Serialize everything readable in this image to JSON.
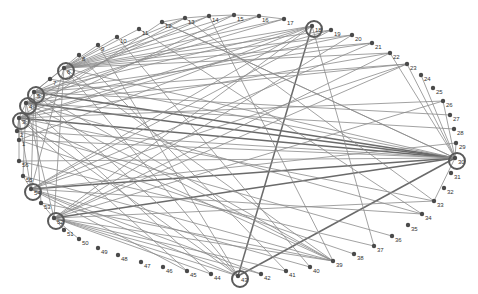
{
  "diagram": {
    "type": "circular-network-graph",
    "colors": {
      "edge": "#8a8a8a",
      "edge_strong": "#6a6a6a",
      "node": "#4a4a4a",
      "hub_ring": "#5a5a5a",
      "label": "#333333"
    },
    "nodes": [
      {
        "id": "1",
        "x": 19,
        "y": 140,
        "hub": false
      },
      {
        "id": "2",
        "x": 17,
        "y": 131,
        "hub": false
      },
      {
        "id": "3",
        "x": 19,
        "y": 118,
        "hub": true
      },
      {
        "id": "4",
        "x": 26,
        "y": 103,
        "hub": true
      },
      {
        "id": "5",
        "x": 34,
        "y": 92,
        "hub": true
      },
      {
        "id": "6",
        "x": 64,
        "y": 68,
        "hub": true
      },
      {
        "id": "7",
        "x": 50,
        "y": 79,
        "hub": false
      },
      {
        "id": "8",
        "x": 79,
        "y": 55,
        "hub": false
      },
      {
        "id": "9",
        "x": 98,
        "y": 45,
        "hub": false
      },
      {
        "id": "10",
        "x": 117,
        "y": 37,
        "hub": false
      },
      {
        "id": "11",
        "x": 139,
        "y": 29,
        "hub": false
      },
      {
        "id": "12",
        "x": 162,
        "y": 22,
        "hub": false
      },
      {
        "id": "13",
        "x": 185,
        "y": 18,
        "hub": false
      },
      {
        "id": "14",
        "x": 209,
        "y": 16,
        "hub": false
      },
      {
        "id": "15",
        "x": 234,
        "y": 15,
        "hub": false
      },
      {
        "id": "16",
        "x": 259,
        "y": 16,
        "hub": false
      },
      {
        "id": "17",
        "x": 284,
        "y": 19,
        "hub": false
      },
      {
        "id": "18",
        "x": 312,
        "y": 26,
        "hub": true
      },
      {
        "id": "19",
        "x": 331,
        "y": 30,
        "hub": false
      },
      {
        "id": "20",
        "x": 352,
        "y": 35,
        "hub": false
      },
      {
        "id": "21",
        "x": 372,
        "y": 43,
        "hub": false
      },
      {
        "id": "22",
        "x": 390,
        "y": 53,
        "hub": false
      },
      {
        "id": "23",
        "x": 407,
        "y": 64,
        "hub": false
      },
      {
        "id": "24",
        "x": 421,
        "y": 75,
        "hub": false
      },
      {
        "id": "25",
        "x": 433,
        "y": 88,
        "hub": false
      },
      {
        "id": "26",
        "x": 443,
        "y": 101,
        "hub": false
      },
      {
        "id": "27",
        "x": 450,
        "y": 115,
        "hub": false
      },
      {
        "id": "28",
        "x": 454,
        "y": 129,
        "hub": false
      },
      {
        "id": "29",
        "x": 456,
        "y": 143,
        "hub": false
      },
      {
        "id": "30",
        "x": 455,
        "y": 158,
        "hub": true
      },
      {
        "id": "31",
        "x": 451,
        "y": 173,
        "hub": false
      },
      {
        "id": "32",
        "x": 444,
        "y": 188,
        "hub": false
      },
      {
        "id": "33",
        "x": 434,
        "y": 201,
        "hub": false
      },
      {
        "id": "34",
        "x": 422,
        "y": 214,
        "hub": false
      },
      {
        "id": "35",
        "x": 408,
        "y": 225,
        "hub": false
      },
      {
        "id": "36",
        "x": 392,
        "y": 236,
        "hub": false
      },
      {
        "id": "37",
        "x": 374,
        "y": 246,
        "hub": false
      },
      {
        "id": "38",
        "x": 354,
        "y": 254,
        "hub": false
      },
      {
        "id": "39",
        "x": 333,
        "y": 261,
        "hub": false
      },
      {
        "id": "40",
        "x": 310,
        "y": 267,
        "hub": false
      },
      {
        "id": "41",
        "x": 286,
        "y": 271,
        "hub": false
      },
      {
        "id": "42",
        "x": 261,
        "y": 274,
        "hub": false
      },
      {
        "id": "43",
        "x": 238,
        "y": 276,
        "hub": true
      },
      {
        "id": "44",
        "x": 211,
        "y": 274,
        "hub": false
      },
      {
        "id": "45",
        "x": 187,
        "y": 271,
        "hub": false
      },
      {
        "id": "46",
        "x": 163,
        "y": 267,
        "hub": false
      },
      {
        "id": "47",
        "x": 141,
        "y": 262,
        "hub": false
      },
      {
        "id": "48",
        "x": 118,
        "y": 255,
        "hub": false
      },
      {
        "id": "49",
        "x": 98,
        "y": 248,
        "hub": false
      },
      {
        "id": "50",
        "x": 79,
        "y": 239,
        "hub": false
      },
      {
        "id": "51",
        "x": 64,
        "y": 230,
        "hub": false
      },
      {
        "id": "52",
        "x": 54,
        "y": 218,
        "hub": true
      },
      {
        "id": "53",
        "x": 41,
        "y": 203,
        "hub": false
      },
      {
        "id": "54",
        "x": 31,
        "y": 189,
        "hub": true
      },
      {
        "id": "55",
        "x": 23,
        "y": 176,
        "hub": false
      },
      {
        "id": "56",
        "x": 19,
        "y": 161,
        "hub": false
      }
    ],
    "edges": [
      [
        "3",
        "30",
        1
      ],
      [
        "4",
        "30",
        1
      ],
      [
        "5",
        "30",
        1
      ],
      [
        "3",
        "18",
        0
      ],
      [
        "6",
        "18",
        0
      ],
      [
        "5",
        "18",
        0
      ],
      [
        "18",
        "43",
        1
      ],
      [
        "30",
        "43",
        1
      ],
      [
        "30",
        "52",
        1
      ],
      [
        "30",
        "54",
        1
      ],
      [
        "30",
        "56",
        0
      ],
      [
        "30",
        "1",
        0
      ],
      [
        "30",
        "2",
        0
      ],
      [
        "30",
        "7",
        0
      ],
      [
        "30",
        "6",
        0
      ],
      [
        "30",
        "12",
        0
      ],
      [
        "30",
        "22",
        0
      ],
      [
        "30",
        "23",
        0
      ],
      [
        "30",
        "26",
        0
      ],
      [
        "30",
        "29",
        0
      ],
      [
        "30",
        "33",
        0
      ],
      [
        "30",
        "24",
        0
      ],
      [
        "3",
        "33",
        0
      ],
      [
        "4",
        "34",
        0
      ],
      [
        "5",
        "39",
        0
      ],
      [
        "6",
        "39",
        0
      ],
      [
        "3",
        "39",
        0
      ],
      [
        "4",
        "39",
        0
      ],
      [
        "52",
        "39",
        0
      ],
      [
        "54",
        "40",
        0
      ],
      [
        "52",
        "41",
        0
      ],
      [
        "54",
        "42",
        0
      ],
      [
        "52",
        "33",
        0
      ],
      [
        "54",
        "34",
        0
      ],
      [
        "3",
        "43",
        0
      ],
      [
        "6",
        "43",
        0
      ],
      [
        "5",
        "43",
        0
      ],
      [
        "4",
        "44",
        0
      ],
      [
        "3",
        "45",
        0
      ],
      [
        "6",
        "9",
        0
      ],
      [
        "6",
        "10",
        0
      ],
      [
        "6",
        "11",
        0
      ],
      [
        "7",
        "8",
        0
      ],
      [
        "5",
        "7",
        0
      ],
      [
        "3",
        "12",
        0
      ],
      [
        "4",
        "13",
        0
      ],
      [
        "5",
        "14",
        0
      ],
      [
        "3",
        "15",
        0
      ],
      [
        "4",
        "16",
        0
      ],
      [
        "5",
        "17",
        0
      ],
      [
        "6",
        "13",
        0
      ],
      [
        "6",
        "14",
        0
      ],
      [
        "6",
        "15",
        0
      ],
      [
        "6",
        "16",
        0
      ],
      [
        "6",
        "17",
        0
      ],
      [
        "12",
        "13",
        0
      ],
      [
        "13",
        "14",
        0
      ],
      [
        "14",
        "15",
        0
      ],
      [
        "15",
        "16",
        0
      ],
      [
        "16",
        "17",
        0
      ],
      [
        "3",
        "19",
        0
      ],
      [
        "4",
        "20",
        0
      ],
      [
        "5",
        "21",
        0
      ],
      [
        "3",
        "22",
        0
      ],
      [
        "4",
        "23",
        0
      ],
      [
        "5",
        "23",
        0
      ],
      [
        "6",
        "19",
        0
      ],
      [
        "6",
        "20",
        0
      ],
      [
        "6",
        "21",
        0
      ],
      [
        "6",
        "22",
        0
      ],
      [
        "52",
        "23",
        0
      ],
      [
        "54",
        "23",
        0
      ],
      [
        "52",
        "26",
        0
      ],
      [
        "54",
        "29",
        0
      ],
      [
        "3",
        "26",
        0
      ],
      [
        "5",
        "27",
        0
      ],
      [
        "4",
        "28",
        0
      ],
      [
        "18",
        "37",
        0
      ],
      [
        "18",
        "52",
        0
      ],
      [
        "18",
        "54",
        0
      ],
      [
        "18",
        "1",
        0
      ],
      [
        "12",
        "30",
        0
      ],
      [
        "13",
        "33",
        0
      ],
      [
        "14",
        "39",
        0
      ],
      [
        "9",
        "43",
        0
      ],
      [
        "11",
        "34",
        0
      ],
      [
        "10",
        "40",
        0
      ],
      [
        "8",
        "41",
        0
      ],
      [
        "52",
        "20",
        0
      ],
      [
        "54",
        "21",
        0
      ],
      [
        "52",
        "22",
        0
      ],
      [
        "54",
        "19",
        0
      ],
      [
        "52",
        "43",
        0
      ],
      [
        "54",
        "43",
        0
      ],
      [
        "52",
        "44",
        0
      ],
      [
        "54",
        "45",
        0
      ],
      [
        "52",
        "42",
        0
      ],
      [
        "1",
        "38",
        0
      ],
      [
        "2",
        "36",
        0
      ],
      [
        "56",
        "37",
        0
      ],
      [
        "55",
        "39",
        0
      ],
      [
        "53",
        "39",
        0
      ],
      [
        "1",
        "3",
        0
      ],
      [
        "2",
        "3",
        0
      ],
      [
        "55",
        "54",
        0
      ],
      [
        "53",
        "52",
        0
      ],
      [
        "51",
        "52",
        0
      ],
      [
        "50",
        "52",
        0
      ],
      [
        "3",
        "4",
        0
      ],
      [
        "4",
        "5",
        0
      ],
      [
        "5",
        "6",
        0
      ],
      [
        "3",
        "54",
        0
      ],
      [
        "4",
        "52",
        0
      ],
      [
        "5",
        "54",
        0
      ],
      [
        "3",
        "56",
        0
      ],
      [
        "4",
        "55",
        0
      ],
      [
        "5",
        "53",
        0
      ],
      [
        "6",
        "52",
        0
      ],
      [
        "6",
        "54",
        0
      ]
    ]
  }
}
